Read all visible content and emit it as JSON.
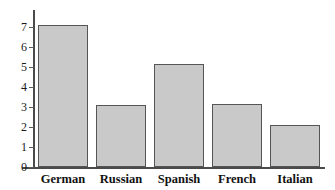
{
  "chart_data": {
    "type": "bar",
    "title": "",
    "subtitle": "",
    "xlabel": "",
    "ylabel": "",
    "categories": [
      "German",
      "Russian",
      "Spanish",
      "French",
      "Italian"
    ],
    "values": [
      7.1,
      3.1,
      5.15,
      3.15,
      2.1
    ],
    "series": [
      {
        "name": "",
        "values": [
          7.1,
          3.1,
          5.15,
          3.15,
          2.1
        ]
      }
    ],
    "ylim": [
      0,
      7.5
    ],
    "y_ticks": [
      0,
      1,
      2,
      3,
      4,
      5,
      6,
      7
    ],
    "y_tick_labels": [
      "0",
      "1",
      "2",
      "3",
      "4",
      "5",
      "6",
      "7"
    ],
    "grid": false,
    "legend": false,
    "legend_position": "none",
    "annotations": [],
    "colors": {
      "bar_fill": "#c9c9c9",
      "bar_stroke": "#555555",
      "axis": "#4a4a4a",
      "text": "#111111",
      "background": "#ffffff"
    }
  }
}
